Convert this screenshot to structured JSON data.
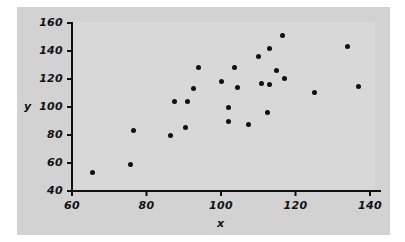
{
  "figure": {
    "background_color": "#ffffff",
    "panel_color": "#d2d2d2",
    "plot_color": "#d8d8d8",
    "axis_color": "#111111",
    "marker_color": "#101010"
  },
  "chart_data": {
    "type": "scatter",
    "title": "",
    "xlabel": "x",
    "ylabel": "y",
    "xlim": [
      60,
      142
    ],
    "ylim": [
      40,
      162
    ],
    "xticks": [
      60,
      80,
      100,
      120,
      140
    ],
    "yticks": [
      40,
      60,
      80,
      100,
      120,
      140,
      160
    ],
    "xtick_labels": [
      "60",
      "80",
      "100",
      "120",
      "140"
    ],
    "ytick_labels": [
      "40",
      "60",
      "80",
      "100",
      "120",
      "140",
      "160"
    ],
    "grid": false,
    "legend": null,
    "series": [
      {
        "name": "observations",
        "marker": "filled-circle",
        "color": "#101010",
        "points": [
          [
            65.6,
            53.5
          ],
          [
            75.6,
            59.0
          ],
          [
            76.5,
            83.5
          ],
          [
            86.5,
            79.5
          ],
          [
            87.5,
            104.0
          ],
          [
            90.5,
            85.5
          ],
          [
            91.0,
            104.0
          ],
          [
            92.5,
            113.5
          ],
          [
            94.0,
            128.0
          ],
          [
            100.0,
            118.5
          ],
          [
            102.0,
            100.0
          ],
          [
            102.0,
            89.5
          ],
          [
            103.5,
            128.0
          ],
          [
            104.5,
            114.0
          ],
          [
            107.5,
            87.5
          ],
          [
            110.0,
            136.0
          ],
          [
            111.0,
            117.0
          ],
          [
            112.5,
            96.0
          ],
          [
            113.0,
            142.0
          ],
          [
            113.0,
            116.0
          ],
          [
            115.0,
            126.0
          ],
          [
            116.5,
            151.0
          ],
          [
            117.0,
            120.5
          ],
          [
            125.0,
            110.5
          ],
          [
            134.0,
            143.0
          ],
          [
            137.0,
            114.5
          ]
        ]
      }
    ]
  }
}
